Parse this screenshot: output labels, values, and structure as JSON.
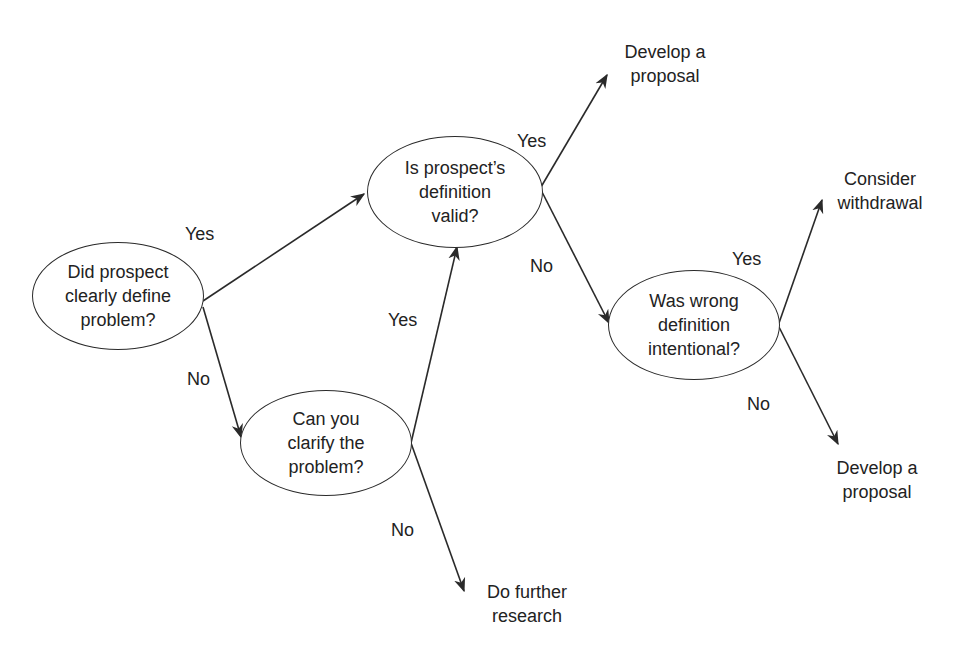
{
  "diagram": {
    "type": "decision-tree",
    "nodes": {
      "define": {
        "lines": [
          "Did prospect",
          "clearly define",
          "problem?"
        ]
      },
      "valid": {
        "lines": [
          "Is prospect’s",
          "definition",
          "valid?"
        ]
      },
      "clarify": {
        "lines": [
          "Can you",
          "clarify the",
          "problem?"
        ]
      },
      "intentional": {
        "lines": [
          "Was wrong",
          "definition",
          "intentional?"
        ]
      }
    },
    "outcomes": {
      "proposal_top": {
        "lines": [
          "Develop a",
          "proposal"
        ]
      },
      "withdrawal": {
        "lines": [
          "Consider",
          "withdrawal"
        ]
      },
      "proposal_bottom": {
        "lines": [
          "Develop a",
          "proposal"
        ]
      },
      "research": {
        "lines": [
          "Do further",
          "research"
        ]
      }
    },
    "edge_labels": {
      "define_yes": "Yes",
      "define_no": "No",
      "clarify_yes": "Yes",
      "clarify_no": "No",
      "valid_yes": "Yes",
      "valid_no": "No",
      "intentional_yes": "Yes",
      "intentional_no": "No"
    },
    "colors": {
      "stroke": "#2a2a2a",
      "text": "#222222",
      "background": "#ffffff"
    }
  }
}
